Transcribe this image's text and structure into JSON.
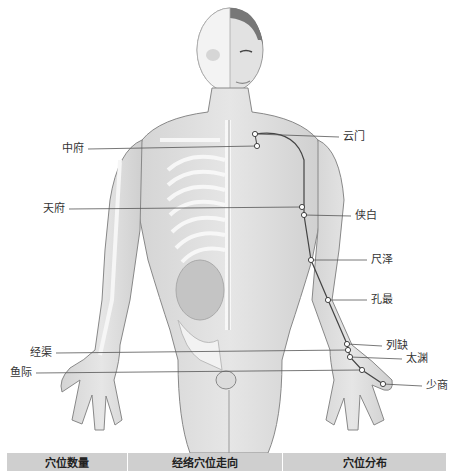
{
  "figure": {
    "line_color": "#555555",
    "point_fill": "#ffffff",
    "points": [
      {
        "name": "云门",
        "x": 255,
        "y": 134,
        "label_x": 343,
        "label_y": 131,
        "side": "right"
      },
      {
        "name": "中府",
        "x": 257,
        "y": 146,
        "label_x": 62,
        "label_y": 143,
        "side": "left"
      },
      {
        "name": "天府",
        "x": 302,
        "y": 207,
        "label_x": 43,
        "label_y": 203,
        "side": "left"
      },
      {
        "name": "侠白",
        "x": 304,
        "y": 215,
        "label_x": 355,
        "label_y": 210,
        "side": "right"
      },
      {
        "name": "尺泽",
        "x": 311,
        "y": 260,
        "label_x": 371,
        "label_y": 254,
        "side": "right"
      },
      {
        "name": "孔最",
        "x": 328,
        "y": 300,
        "label_x": 371,
        "label_y": 294,
        "side": "right"
      },
      {
        "name": "列缺",
        "x": 347,
        "y": 344,
        "label_x": 386,
        "label_y": 340,
        "side": "right"
      },
      {
        "name": "经渠",
        "x": 348,
        "y": 350,
        "label_x": 30,
        "label_y": 347,
        "side": "left"
      },
      {
        "name": "太渊",
        "x": 350,
        "y": 357,
        "label_x": 406,
        "label_y": 353,
        "side": "right"
      },
      {
        "name": "鱼际",
        "x": 362,
        "y": 370,
        "label_x": 10,
        "label_y": 367,
        "side": "left"
      },
      {
        "name": "少商",
        "x": 383,
        "y": 384,
        "label_x": 426,
        "label_y": 380,
        "side": "right"
      }
    ]
  },
  "table": {
    "headers": [
      "穴位数量",
      "经络穴位走向",
      "穴位分布"
    ],
    "header_bg": "#cfcfcf"
  }
}
